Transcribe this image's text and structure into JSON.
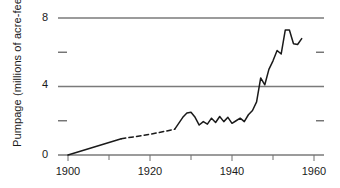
{
  "chart_data": {
    "type": "line",
    "title": "",
    "xlabel": "",
    "ylabel": "Pumpage (millions of acre-feet)",
    "xlim": [
      1900,
      1960
    ],
    "ylim": [
      0,
      8
    ],
    "grid": true,
    "grid_values": [
      0,
      4,
      8
    ],
    "legend": "none",
    "x_major_ticks": [
      1900,
      1920,
      1940,
      1960
    ],
    "x_major_tick_labels": [
      "1900",
      "1920",
      "1940",
      "1960"
    ],
    "x_minor_ticks": [
      1910,
      1930,
      1950
    ],
    "y_major_ticks": [
      0,
      4,
      8
    ],
    "y_major_tick_labels": [
      "0",
      "4",
      "8"
    ],
    "y_minor_ticks": [
      2,
      6
    ],
    "series": [
      {
        "name": "Estimated pumpage (interpolated)",
        "style": "solid",
        "x": [
          1900,
          1913
        ],
        "values": [
          0.0,
          0.95
        ]
      },
      {
        "name": "Estimated pumpage (interpolated)",
        "style": "dashed",
        "x": [
          1913,
          1918,
          1922,
          1926
        ],
        "values": [
          0.95,
          1.13,
          1.3,
          1.5
        ]
      },
      {
        "name": "Measured pumpage",
        "style": "solid",
        "x": [
          1926,
          1927,
          1928,
          1929,
          1930,
          1931,
          1932,
          1933,
          1934,
          1935,
          1936,
          1937,
          1938,
          1939,
          1940,
          1941,
          1942,
          1943,
          1944,
          1945,
          1946,
          1947,
          1948,
          1949,
          1950,
          1951,
          1952,
          1953,
          1954,
          1955,
          1956,
          1957
        ],
        "values": [
          1.5,
          1.85,
          2.2,
          2.45,
          2.5,
          2.2,
          1.75,
          1.95,
          1.8,
          2.15,
          1.9,
          2.25,
          1.95,
          2.2,
          1.85,
          2.0,
          2.15,
          1.95,
          2.35,
          2.6,
          3.1,
          4.5,
          4.1,
          5.0,
          5.5,
          6.1,
          5.9,
          7.3,
          7.3,
          6.5,
          6.45,
          6.8
        ]
      }
    ]
  },
  "axis_title": {
    "y": "Pumpage (millions of acre-feet)"
  },
  "colors": {
    "grid": "#7a7a7a",
    "data_line": "#1a1a1a",
    "tick": "#6e6e6e",
    "text": "#1a1a1a",
    "background": "#ffffff"
  }
}
